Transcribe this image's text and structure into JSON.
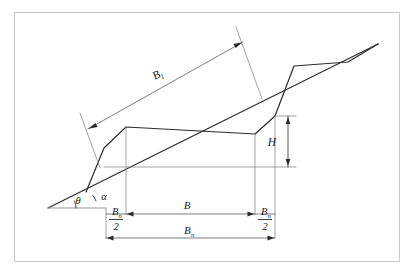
{
  "figure": {
    "kind": "engineering-geometry-diagram",
    "border_color": "#c8c8c8",
    "background_color": "#ffffff",
    "line_color": "#2b2b2b",
    "thin_line_color": "#8c8c8c",
    "dimension_line_color": "#6e6e6e"
  },
  "labels": {
    "b_l": {
      "base": "B",
      "sub": "l"
    },
    "b": {
      "base": "B",
      "sub": ""
    },
    "b_n_half_left": {
      "num_base": "B",
      "num_sub": "n",
      "den": "2"
    },
    "b_n_half_right": {
      "num_base": "B",
      "num_sub": "n",
      "den": "2"
    },
    "b_n_total": {
      "base": "B",
      "sub": "n"
    },
    "height": {
      "base": "H",
      "sub": ""
    },
    "theta": {
      "glyph": "θ"
    },
    "alpha": {
      "glyph": "α"
    }
  }
}
